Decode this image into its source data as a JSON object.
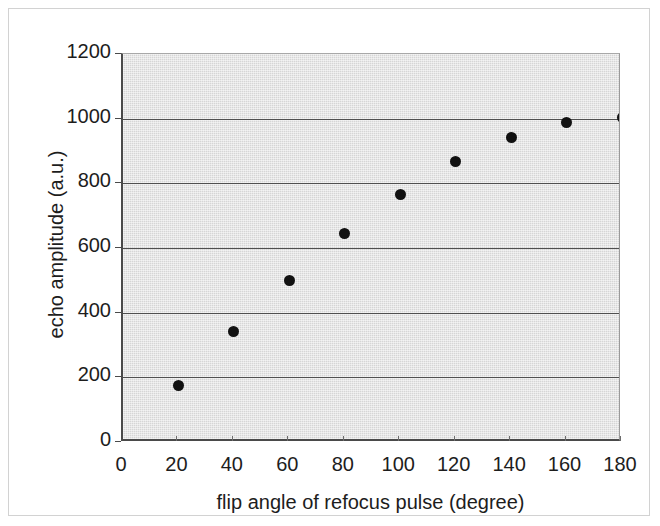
{
  "chart_data": {
    "type": "scatter",
    "title": "",
    "xlabel": "flip angle of refocus pulse (degree)",
    "ylabel": "echo amplitude (a.u.)",
    "x": [
      20,
      40,
      60,
      80,
      100,
      120,
      140,
      160,
      180
    ],
    "values": [
      175,
      342,
      500,
      645,
      765,
      868,
      942,
      988,
      1005
    ],
    "xlim": [
      0,
      180
    ],
    "ylim": [
      0,
      1200
    ],
    "xticks": [
      0,
      20,
      40,
      60,
      80,
      100,
      120,
      140,
      160,
      180
    ],
    "yticks": [
      0,
      200,
      400,
      600,
      800,
      1000,
      1200
    ],
    "xtick_labels": [
      "0",
      "20",
      "40",
      "60",
      "80",
      "100",
      "120",
      "140",
      "160",
      "180"
    ],
    "ytick_labels": [
      "0",
      "200",
      "400",
      "600",
      "800",
      "1000",
      "1200"
    ],
    "grid": "horizontal",
    "legend": "none",
    "marker": "filled-circle",
    "marker_color": "#111111",
    "plot_background": "#d6d6d6",
    "axis_color": "#4a4a4a",
    "gridline_color": "#4f4f4f",
    "series": [
      {
        "name": "echo amplitude",
        "points": [
          {
            "x": 20,
            "y": 175
          },
          {
            "x": 40,
            "y": 342
          },
          {
            "x": 60,
            "y": 500
          },
          {
            "x": 80,
            "y": 645
          },
          {
            "x": 100,
            "y": 765
          },
          {
            "x": 120,
            "y": 868
          },
          {
            "x": 140,
            "y": 942
          },
          {
            "x": 160,
            "y": 988
          },
          {
            "x": 180,
            "y": 1005
          }
        ]
      }
    ]
  }
}
